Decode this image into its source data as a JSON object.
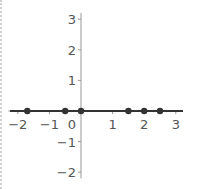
{
  "chart_data": {
    "type": "scatter",
    "title": "",
    "xlabel": "",
    "ylabel": "",
    "xlim": [
      -2.3,
      3.2
    ],
    "ylim": [
      -2.2,
      3.2
    ],
    "grid": false,
    "x_ticks": [
      -2,
      -1,
      0,
      1,
      2,
      3
    ],
    "y_ticks": [
      -2,
      -1,
      1,
      2,
      3
    ],
    "x_tick_labels": [
      "−2",
      "−1",
      "0",
      "1",
      "2",
      "3"
    ],
    "y_tick_labels": [
      "−2",
      "−1",
      "1",
      "2",
      "3"
    ],
    "points": [
      {
        "x": -1.7,
        "y": 0
      },
      {
        "x": -0.5,
        "y": 0
      },
      {
        "x": 0,
        "y": 0
      },
      {
        "x": 1.5,
        "y": 0
      },
      {
        "x": 2,
        "y": 0
      },
      {
        "x": 2.5,
        "y": 0
      }
    ],
    "line": {
      "y": 0,
      "description": "horizontal line y = 0 drawn along x-axis"
    },
    "colors": {
      "axis": "#999999",
      "line": "#333333",
      "points": "#333333"
    }
  }
}
